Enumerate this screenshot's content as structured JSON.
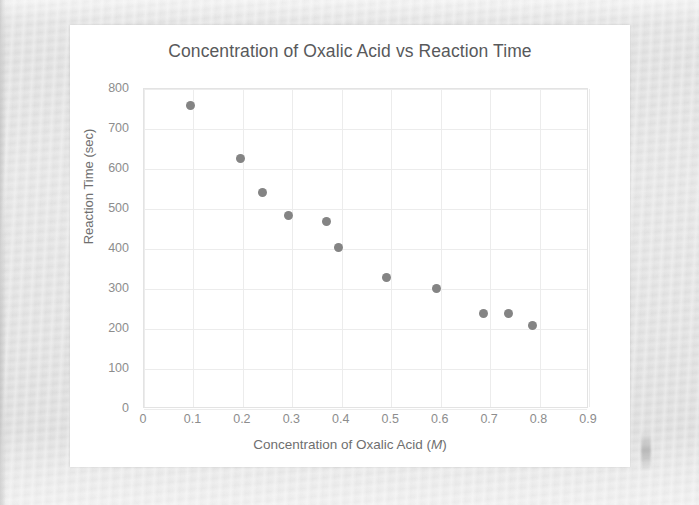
{
  "chart_data": {
    "type": "scatter",
    "title": "Concentration of Oxalic Acid vs Reaction Time",
    "xlabel": "Concentration of Oxalic Acid (M)",
    "xlabel_prefix": "Concentration of Oxalic Acid (",
    "xlabel_unit": "M",
    "xlabel_suffix": ")",
    "ylabel": "Reaction Time (sec)",
    "xlim": [
      0,
      0.9
    ],
    "ylim": [
      0,
      800
    ],
    "xticks": [
      "0",
      "0.1",
      "0.2",
      "0.3",
      "0.4",
      "0.5",
      "0.6",
      "0.7",
      "0.8",
      "0.9"
    ],
    "xtick_values": [
      0,
      0.1,
      0.2,
      0.3,
      0.4,
      0.5,
      0.6,
      0.7,
      0.8,
      0.9
    ],
    "yticks": [
      "0",
      "100",
      "200",
      "300",
      "400",
      "500",
      "600",
      "700",
      "800"
    ],
    "ytick_values": [
      0,
      100,
      200,
      300,
      400,
      500,
      600,
      700,
      800
    ],
    "grid": true,
    "legend": false,
    "marker_color": "#848484",
    "grid_color": "#ececec",
    "series": [
      {
        "name": "Reaction Time",
        "x": [
          0.095,
          0.195,
          0.24,
          0.293,
          0.37,
          0.394,
          0.49,
          0.592,
          0.687,
          0.737,
          0.786
        ],
        "y": [
          760,
          627,
          542,
          485,
          470,
          405,
          328,
          301,
          240,
          238,
          208
        ]
      }
    ]
  },
  "page": {
    "background_color": "#e2e2e2",
    "card_color": "#ffffff"
  }
}
